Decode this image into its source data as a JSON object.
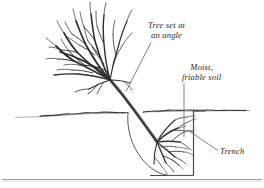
{
  "figure": {
    "kind": "horticultural-diagram",
    "background_color": "#ffffff",
    "ink_color": "#2b2b2b",
    "line_color": "#555555"
  },
  "labels": {
    "tree_angle": {
      "line1": "Tree set at",
      "line2": "an angle"
    },
    "moist_soil": {
      "line1": "Moist,",
      "line2": "friable soil"
    },
    "trench": {
      "text": "Trench"
    }
  },
  "parts": {
    "canopy": "bare-branch-canopy",
    "trunk": "angled-trunk",
    "roots": "fanned-root-system",
    "ground_line": "soil-surface-line",
    "trench_wall": "trench-vertical-wall",
    "trench_floor": "trench-bottom",
    "planting_hole": "curved-planting-hole-outline",
    "bottom_rule": "page-divider-rule"
  }
}
